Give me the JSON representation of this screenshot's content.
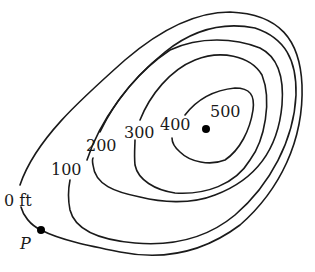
{
  "diagram": {
    "type": "topographic contour map",
    "contours": [
      {
        "elevation": 0,
        "label": "0 ft"
      },
      {
        "elevation": 100,
        "label": "100"
      },
      {
        "elevation": 200,
        "label": "200"
      },
      {
        "elevation": 300,
        "label": "300"
      },
      {
        "elevation": 400,
        "label": "400"
      },
      {
        "elevation": 500,
        "label": "500"
      }
    ],
    "points": {
      "p": {
        "label": "P"
      },
      "summit": {
        "label": "500"
      }
    },
    "colors": {
      "line": "#1a1a1a",
      "background": "#ffffff"
    }
  }
}
